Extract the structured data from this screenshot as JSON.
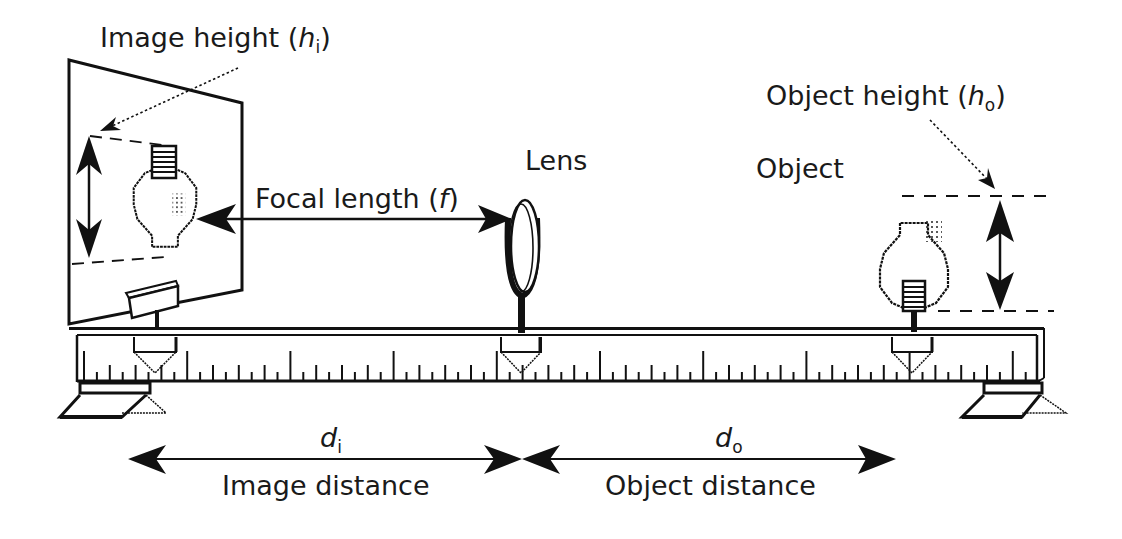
{
  "diagram": {
    "type": "optical bench lens diagram",
    "labels": {
      "image_height": {
        "text": "Image height (",
        "symbol": "h",
        "subscript": "i",
        "close": ")"
      },
      "object_height": {
        "text": "Object height (",
        "symbol": "h",
        "subscript": "o",
        "close": ")"
      },
      "focal_length": {
        "text": "Focal length (",
        "symbol": "f",
        "close": ")"
      },
      "lens": "Lens",
      "object": "Object",
      "image_distance": {
        "symbol": "d",
        "subscript": "i",
        "text": "Image distance"
      },
      "object_distance": {
        "symbol": "d",
        "subscript": "o",
        "text": "Object distance"
      }
    },
    "components": [
      {
        "id": "screen",
        "name": "Screen with image of bulb"
      },
      {
        "id": "lens",
        "name": "Lens on holder"
      },
      {
        "id": "object",
        "name": "Light bulb object"
      },
      {
        "id": "optical-bench",
        "name": "Graduated optical bench rail"
      }
    ],
    "colors": {
      "ink": "#111111",
      "background": "#ffffff"
    }
  }
}
